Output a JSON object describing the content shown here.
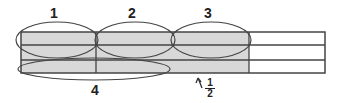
{
  "diagram": {
    "labels": {
      "one": "1",
      "two": "2",
      "three": "3",
      "four": "4"
    },
    "fraction": {
      "numerator": "1",
      "denominator": "2"
    },
    "colors": {
      "shade": "#d8d8d8",
      "stroke": "#333333"
    }
  }
}
